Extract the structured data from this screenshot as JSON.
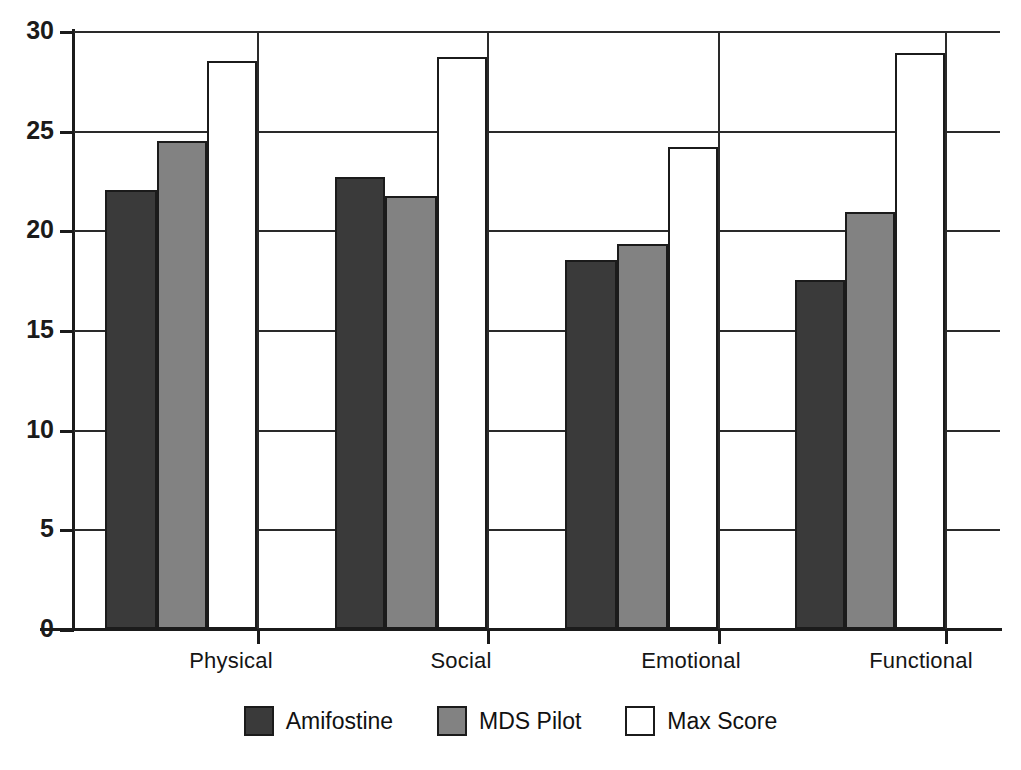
{
  "chart_data": {
    "type": "bar",
    "title": "",
    "subtitle": "",
    "xlabel": "",
    "ylabel": "",
    "categories": [
      "Physical",
      "Social",
      "Emotional",
      "Functional"
    ],
    "series": [
      {
        "name": "Amifostine",
        "color": "#3a3a3a",
        "values": [
          22.0,
          22.7,
          18.5,
          17.5
        ]
      },
      {
        "name": "MDS Pilot",
        "color": "#828282",
        "values": [
          24.5,
          21.7,
          19.3,
          20.9
        ]
      },
      {
        "name": "Max Score",
        "color": "#ffffff",
        "values": [
          28.5,
          28.7,
          24.2,
          28.9
        ]
      }
    ],
    "ylim": [
      0,
      30
    ],
    "yticks": [
      0,
      5,
      10,
      15,
      20,
      25,
      30
    ],
    "ytick_labels": [
      "0",
      "5",
      "10",
      "15",
      "20",
      "25",
      "30"
    ],
    "grid": true,
    "grid_axis": "y",
    "legend_position": "bottom",
    "annotations": []
  },
  "legend": {
    "items": [
      {
        "label": "Amifostine",
        "swatch": "legend-swatch-amifostine"
      },
      {
        "label": "MDS Pilot",
        "swatch": "legend-swatch-mds-pilot"
      },
      {
        "label": "Max Score",
        "swatch": "legend-swatch-max-score"
      }
    ]
  }
}
